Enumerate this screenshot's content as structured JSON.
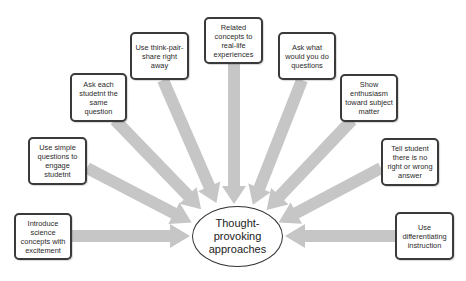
{
  "diagram": {
    "type": "radial-arrow-diagram",
    "center": {
      "label": "Thought-provoking approaches",
      "lines": [
        "Thought-",
        "provoking",
        "approaches"
      ]
    },
    "colors": {
      "arrow": "#c6c6c6",
      "box_border": "#3a3a3a",
      "text": "#2a2a2a",
      "background": "#ffffff"
    },
    "nodes": [
      {
        "id": "n1",
        "label": "Introduce science concepts with excitement"
      },
      {
        "id": "n2",
        "label": "Use simple questions to engage studetnt"
      },
      {
        "id": "n3",
        "label": "Ask each studetnt the same question"
      },
      {
        "id": "n4",
        "label": "Use think-pair-share right away"
      },
      {
        "id": "n5",
        "label": "Related concepts to real-life experiences"
      },
      {
        "id": "n6",
        "label": "Ask what would you do questions"
      },
      {
        "id": "n7",
        "label": "Show enthusiasm toward subject matter"
      },
      {
        "id": "n8",
        "label": "Tell student there is no right or wrong answer"
      },
      {
        "id": "n9",
        "label": "Use differentiating instruction"
      }
    ],
    "edges": [
      {
        "from": "n1",
        "to": "center"
      },
      {
        "from": "n2",
        "to": "center"
      },
      {
        "from": "n3",
        "to": "center"
      },
      {
        "from": "n4",
        "to": "center"
      },
      {
        "from": "n5",
        "to": "center"
      },
      {
        "from": "n6",
        "to": "center"
      },
      {
        "from": "n7",
        "to": "center"
      },
      {
        "from": "n8",
        "to": "center"
      },
      {
        "from": "n9",
        "to": "center"
      }
    ]
  }
}
